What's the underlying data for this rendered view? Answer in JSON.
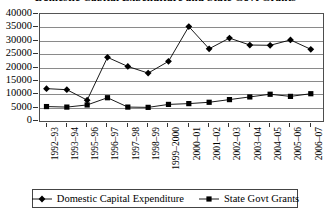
{
  "chart_data": {
    "type": "line",
    "title": "Domestic Capital Expenditure and State Govt Grants",
    "xlabel": "",
    "ylabel": "",
    "ylim": [
      0,
      40000
    ],
    "ytick_step": 5000,
    "yticks": [
      "40000",
      "35000",
      "30000",
      "25000",
      "20000",
      "15000",
      "10000",
      "5000",
      "0"
    ],
    "grid": true,
    "legend_position": "bottom",
    "categories": [
      "1992–93",
      "1993–94",
      "1995–96",
      "1996–97",
      "1997–98",
      "1998–99",
      "1999–2000",
      "2000–01",
      "2001–02",
      "2002–03",
      "2003–04",
      "2004–05",
      "2005–06",
      "2006–07"
    ],
    "series": [
      {
        "name": "Domestic Capital Expenditure",
        "marker": "diamond",
        "color": "#000000",
        "values": [
          12100,
          11700,
          7800,
          23800,
          20400,
          17900,
          22300,
          35300,
          27000,
          31000,
          28400,
          28300,
          30300,
          26800
        ]
      },
      {
        "name": "State Govt Grants",
        "marker": "square",
        "color": "#000000",
        "values": [
          5400,
          5200,
          6000,
          8700,
          5200,
          5100,
          6200,
          6500,
          7000,
          8000,
          9000,
          10000,
          9200,
          10200
        ]
      }
    ]
  },
  "legend": {
    "items": [
      {
        "label": "Domestic Capital Expenditure",
        "marker": "diamond"
      },
      {
        "label": "State Govt Grants",
        "marker": "square"
      }
    ]
  }
}
